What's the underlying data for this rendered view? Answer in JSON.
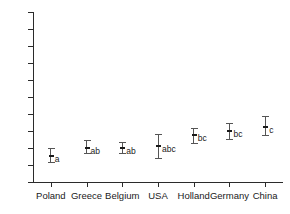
{
  "chart_data": {
    "type": "scatter",
    "title": "",
    "subtitle": "",
    "xlabel": "",
    "ylabel": "",
    "ylim": [
      0,
      100
    ],
    "yticks": [
      0,
      10,
      20,
      30,
      40,
      50,
      60,
      70,
      80,
      90,
      100
    ],
    "grid": false,
    "legend": "none",
    "error_bar_style": "capped-vertical",
    "annotation_note": "lowercase letters denote statistical significance groupings",
    "categories": [
      "Poland",
      "Greece",
      "Belgium",
      "USA",
      "Holland",
      "Germany",
      "China"
    ],
    "values": [
      15.5,
      20.0,
      20.0,
      21.0,
      27.5,
      30.0,
      32.5
    ],
    "error_low": [
      11.5,
      17.0,
      17.0,
      14.0,
      23.0,
      25.5,
      27.5
    ],
    "error_high": [
      20.0,
      24.5,
      23.5,
      28.0,
      31.5,
      34.5,
      39.0
    ],
    "group_letters": [
      "a",
      "ab",
      "ab",
      "abc",
      "bc",
      "bc",
      "c"
    ],
    "series": [
      {
        "name": "mean with range",
        "points": [
          {
            "category": "Poland",
            "mean": 15.5,
            "low": 11.5,
            "high": 20.0,
            "group": "a"
          },
          {
            "category": "Greece",
            "mean": 20.0,
            "low": 17.0,
            "high": 24.5,
            "group": "ab"
          },
          {
            "category": "Belgium",
            "mean": 20.0,
            "low": 17.0,
            "high": 23.5,
            "group": "ab"
          },
          {
            "category": "USA",
            "mean": 21.0,
            "low": 14.0,
            "high": 28.0,
            "group": "abc"
          },
          {
            "category": "Holland",
            "mean": 27.5,
            "low": 23.0,
            "high": 31.5,
            "group": "bc"
          },
          {
            "category": "Germany",
            "mean": 30.0,
            "low": 25.5,
            "high": 34.5,
            "group": "bc"
          },
          {
            "category": "China",
            "mean": 32.5,
            "low": 27.5,
            "high": 39.0,
            "group": "c"
          }
        ]
      }
    ]
  },
  "colors": {
    "axis": "#2b2b2b",
    "text": "#1a1a1a",
    "errorbar": "#555555",
    "marker": "#1a1a1a",
    "background": "#ffffff"
  }
}
